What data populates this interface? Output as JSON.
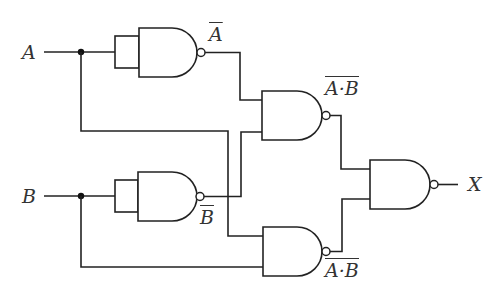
{
  "diagram": {
    "inputs": {
      "a": "A",
      "b": "B"
    },
    "output": "X",
    "signals": {
      "not_a": "A",
      "not_b": "B",
      "nand_nota_notb_left": "A",
      "nand_nota_notb_dot": "·",
      "nand_nota_notb_right": "B",
      "nand_a_b_left": "A",
      "nand_a_b_dot": "·",
      "nand_a_b_right": "B"
    },
    "signal_descriptions": {
      "not_a": "A̅ (NOT A)",
      "not_b": "B̅ (NOT B)",
      "gate3_out": "NOT(A̅ · B̅)",
      "gate4_out": "NOT(A · B)"
    },
    "gates": [
      {
        "id": "g1",
        "type": "NAND (inputs tied)",
        "inputs": [
          "A",
          "A"
        ],
        "output": "A̅"
      },
      {
        "id": "g2",
        "type": "NAND (inputs tied)",
        "inputs": [
          "B",
          "B"
        ],
        "output": "B̅"
      },
      {
        "id": "g3",
        "type": "NAND",
        "inputs": [
          "A̅",
          "B̅"
        ],
        "output": "NOT(A̅·B̅)"
      },
      {
        "id": "g4",
        "type": "NAND",
        "inputs": [
          "A",
          "B"
        ],
        "output": "NOT(A·B)"
      },
      {
        "id": "g5",
        "type": "NAND",
        "inputs": [
          "NOT(A̅·B̅)",
          "NOT(A·B)"
        ],
        "output": "X"
      }
    ],
    "colors": {
      "line": "#222222",
      "background": "#ffffff"
    }
  }
}
